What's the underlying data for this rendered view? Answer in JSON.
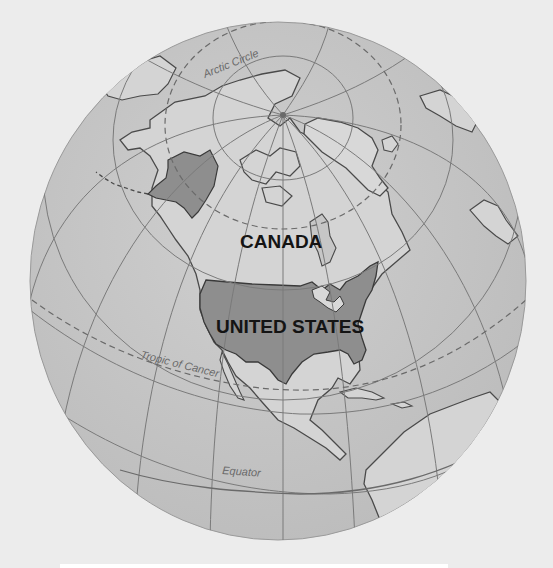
{
  "map": {
    "title": "North America globe",
    "colors": {
      "background": "#ececec",
      "ocean": "#c4c4c4",
      "land": "#d2d2d2",
      "united_states": "#8e8e8e",
      "coastline": "#4a4a4a",
      "graticule": "#7a7a7a",
      "label": "#141414"
    },
    "labels": {
      "canada": "CANADA",
      "united_states": "UNITED STATES"
    },
    "lines": {
      "arctic_circle": "Arctic Circle",
      "tropic_of_cancer": "Tropic of Cancer",
      "equator": "Equator"
    }
  }
}
